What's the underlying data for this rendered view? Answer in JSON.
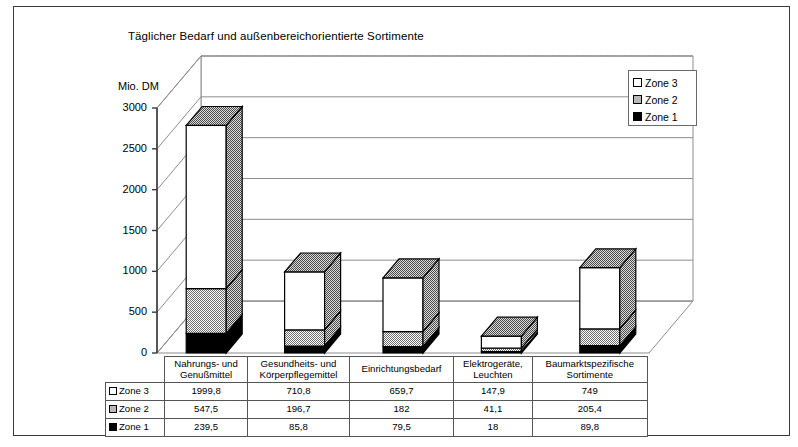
{
  "chart_title": "Täglicher Bedarf und außenbereichorientierte Sortimente",
  "axis_unit": "Mio. DM",
  "legend": {
    "items": [
      {
        "label": "Zone 3",
        "swatch": "white-square-icon",
        "color": "#ffffff"
      },
      {
        "label": "Zone 2",
        "swatch": "gray-square-icon",
        "color": "#b9b9b9"
      },
      {
        "label": "Zone 1",
        "swatch": "black-square-icon",
        "color": "#000000"
      }
    ]
  },
  "chart_data": {
    "type": "bar",
    "title": "Täglicher Bedarf und außenbereichorientierte Sortimente",
    "xlabel": "",
    "ylabel": "Mio. DM",
    "ylim": [
      0,
      3000
    ],
    "yticks": [
      "0",
      "500",
      "1000",
      "1500",
      "2000",
      "2500",
      "3000"
    ],
    "grid": true,
    "stacked": true,
    "legend_position": "top-right",
    "categories": [
      "Nahrungs- und Genußmittel",
      "Gesundheits- und Körperpflegemittel",
      "Einrichtungsbedarf",
      "Elektrogeräte, Leuchten",
      "Baumarktspezifische Sortimente"
    ],
    "series": [
      {
        "name": "Zone 3",
        "color": "#ffffff",
        "values": [
          1999.8,
          710.8,
          659.7,
          147.9,
          749
        ]
      },
      {
        "name": "Zone 2",
        "color": "#b9b9b9",
        "values": [
          547.5,
          196.7,
          182,
          41.1,
          205.4
        ]
      },
      {
        "name": "Zone 1",
        "color": "#000000",
        "values": [
          239.5,
          85.8,
          79.5,
          18,
          89.8
        ]
      }
    ]
  },
  "table": {
    "columns": [
      {
        "line1": "Nahrungs- und",
        "line2": "Genußmittel"
      },
      {
        "line1": "Gesundheits- und",
        "line2": "Körperpflegemittel"
      },
      {
        "line1": "Einrichtungsbedarf",
        "line2": ""
      },
      {
        "line1": "Elektrogeräte,",
        "line2": "Leuchten"
      },
      {
        "line1": "Baumarktspezifische",
        "line2": "Sortimente"
      }
    ],
    "rows": [
      {
        "label": "Zone 3",
        "swatch": "white-square-icon",
        "values": [
          "1999,8",
          "710,8",
          "659,7",
          "147,9",
          "749"
        ]
      },
      {
        "label": "Zone 2",
        "swatch": "gray-square-icon",
        "values": [
          "547,5",
          "196,7",
          "182",
          "41,1",
          "205,4"
        ]
      },
      {
        "label": "Zone 1",
        "swatch": "black-square-icon",
        "values": [
          "239,5",
          "85,8",
          "79,5",
          "18",
          "89,8"
        ]
      }
    ]
  }
}
